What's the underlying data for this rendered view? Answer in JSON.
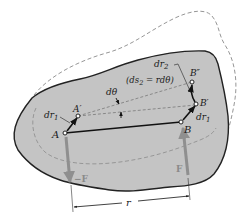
{
  "diagram": {
    "type": "rigid body rotation / work of a couple",
    "colors": {
      "body_fill": "#c4c4c4",
      "body_outline": "#222222",
      "ghost_outline": "#8a8a8a",
      "force_arrow": "#8f8f8f",
      "line": "#111111"
    },
    "labels": {
      "point_A": "A",
      "point_A_prime": "A′",
      "point_B": "B",
      "point_B_prime": "B′",
      "point_B_double_prime": "B″",
      "dr1_left": "dr",
      "dr1_left_sub": "1",
      "dr1_right": "dr",
      "dr1_right_sub": "1",
      "dr2": "dr",
      "dr2_sub": "2",
      "ds2_eq_open": "(ds",
      "ds2_sub": "2",
      "ds2_eq_rest": " = rdθ)",
      "dtheta": "dθ",
      "force_neg": "−F",
      "force_pos": "F",
      "distance_r": "r"
    }
  }
}
